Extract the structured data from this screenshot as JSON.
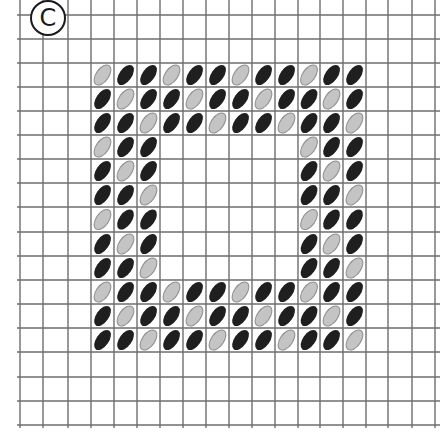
{
  "figure": {
    "label": "C",
    "grid": {
      "vertical_lines_x": [
        20,
        43,
        68,
        91,
        114,
        137,
        160,
        183,
        206,
        229,
        252,
        275,
        298,
        320,
        343,
        366,
        388,
        412,
        435
      ],
      "horizontal_lines_y": [
        15,
        39,
        63,
        87,
        111,
        135,
        159,
        183,
        207,
        232,
        256,
        280,
        304,
        328,
        352,
        377,
        401,
        425
      ],
      "line_color": "#6e6e6e"
    },
    "pattern": {
      "description": "Square frame of diagonal ellipses, 12x12 cells with 3-cell-wide border; every third stitch on a diagonal is light",
      "col_start_line": 3,
      "row_start_line": 2,
      "cols": 12,
      "rows": 12,
      "border_width": 3,
      "rows_data": [
        "LDDLDDLDDLDD",
        "DLDDLDDLDDLD",
        "DDLDDLDDLDDL",
        "LDD......LDD",
        "DLD......DLD",
        "DDL......DDL",
        "LDD......LDD",
        "DLD......DLD",
        "DDL......DDL",
        "LDDLDDLDDLDD",
        "DLDDLDDLDDLD",
        "DDLDDLDDLDDL"
      ],
      "colors": {
        "dark_fill": "#1f1f1f",
        "light_fill": "#c4c4c4",
        "light_stroke": "#8f8f8f"
      }
    }
  }
}
